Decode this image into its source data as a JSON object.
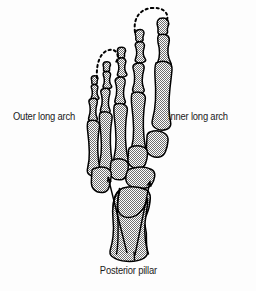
{
  "figure": {
    "type": "anatomical-diagram",
    "background_color": "#fdfdfd",
    "bone_fill_color": "#a0a0a0",
    "bone_outline_color": "#000000",
    "annotation_color": "#1b1b1b"
  },
  "labels": {
    "outer_arch": "Outer long arch",
    "inner_arch": "Inner long arch",
    "posterior_pillar": "Posterior pillar"
  },
  "annotations": {
    "arcs": [
      {
        "name": "outer-long-arch-arc",
        "style": "dashed",
        "description": "Dashed hook curving over the fifth toe"
      },
      {
        "name": "inner-long-arch-arc",
        "style": "dashed",
        "description": "Dashed arc spanning from the second toe over to the great toe"
      }
    ],
    "arrows": [
      {
        "name": "outer-pillar-arrow",
        "description": "Arrow running from the calcaneus forward to the cuboid"
      },
      {
        "name": "inner-pillar-arrow",
        "description": "Arrow running from the calcaneus forward to the navicular"
      }
    ]
  },
  "bone_groups": [
    {
      "name": "phalanges",
      "count": 14
    },
    {
      "name": "metatarsals",
      "count": 5
    },
    {
      "name": "cuneiforms",
      "count": 3
    },
    {
      "name": "cuboid",
      "count": 1
    },
    {
      "name": "navicular",
      "count": 1
    },
    {
      "name": "talus",
      "count": 1
    },
    {
      "name": "calcaneus",
      "count": 1
    }
  ]
}
